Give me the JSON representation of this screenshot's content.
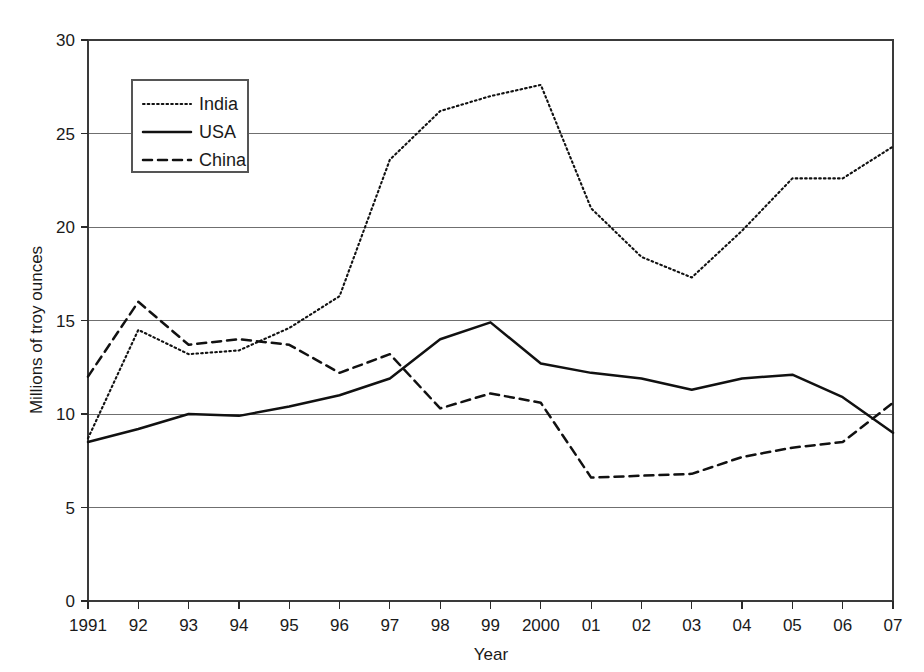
{
  "chart_data": {
    "type": "line",
    "title": "",
    "xlabel": "Year",
    "ylabel": "Millions of troy ounces",
    "grid": true,
    "legend_position": "upper-left-inside",
    "xlim": [
      1991,
      2007
    ],
    "ylim": [
      0,
      30
    ],
    "yticks": [
      0,
      5,
      10,
      15,
      20,
      25,
      30
    ],
    "ytick_labels": [
      "0",
      "5",
      "10",
      "15",
      "20",
      "25",
      "30"
    ],
    "x": [
      1991,
      1992,
      1993,
      1994,
      1995,
      1996,
      1997,
      1998,
      1999,
      2000,
      2001,
      2002,
      2003,
      2004,
      2005,
      2006,
      2007
    ],
    "categories": [
      "1991",
      "92",
      "93",
      "94",
      "95",
      "96",
      "97",
      "98",
      "99",
      "2000",
      "01",
      "02",
      "03",
      "04",
      "05",
      "06",
      "07"
    ],
    "series": [
      {
        "name": "India",
        "style": "dotted",
        "values": [
          8.7,
          14.5,
          13.2,
          13.4,
          14.6,
          16.3,
          23.6,
          26.2,
          27.0,
          27.6,
          21.0,
          18.4,
          17.3,
          19.8,
          22.6,
          22.6,
          24.3
        ]
      },
      {
        "name": "USA",
        "style": "solid",
        "values": [
          8.5,
          9.2,
          10.0,
          9.9,
          10.4,
          11.0,
          11.9,
          14.0,
          14.9,
          12.7,
          12.2,
          11.9,
          11.3,
          11.9,
          12.1,
          10.9,
          9.0
        ]
      },
      {
        "name": "China",
        "style": "dashed",
        "values": [
          12.0,
          16.0,
          13.7,
          14.0,
          13.7,
          12.2,
          13.2,
          10.3,
          11.1,
          10.6,
          6.6,
          6.7,
          6.8,
          7.7,
          8.2,
          8.5,
          10.6
        ]
      }
    ]
  },
  "legend": {
    "entries": [
      {
        "label": "India",
        "style": "dotted"
      },
      {
        "label": "USA",
        "style": "solid"
      },
      {
        "label": "China",
        "style": "dashed"
      }
    ]
  },
  "axes": {
    "y_title": "Millions of troy ounces",
    "x_title": "Year"
  },
  "colors": {
    "line": "#111111",
    "grid": "#6f6f6f",
    "frame": "#3a3a3a",
    "background": "#ffffff",
    "text": "#1a1a1a"
  }
}
